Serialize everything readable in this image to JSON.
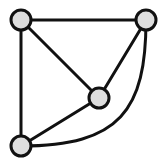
{
  "diagram": {
    "type": "graph",
    "colors": {
      "edge": "#111111",
      "node_fill": "#dedede",
      "node_stroke": "#111111",
      "background": "#ffffff"
    },
    "nodes": [
      {
        "id": "top-left",
        "x": 21,
        "y": 20,
        "r": 10
      },
      {
        "id": "top-right",
        "x": 146,
        "y": 20,
        "r": 10
      },
      {
        "id": "center",
        "x": 99,
        "y": 98,
        "r": 10
      },
      {
        "id": "bottom-left",
        "x": 21,
        "y": 146,
        "r": 10
      }
    ],
    "edges": [
      {
        "from": "top-left",
        "to": "top-right",
        "shape": "straight"
      },
      {
        "from": "top-left",
        "to": "bottom-left",
        "shape": "straight"
      },
      {
        "from": "top-left",
        "to": "center",
        "shape": "straight"
      },
      {
        "from": "top-right",
        "to": "center",
        "shape": "straight"
      },
      {
        "from": "center",
        "to": "bottom-left",
        "shape": "straight"
      },
      {
        "from": "top-right",
        "to": "bottom-left",
        "shape": "curved"
      }
    ]
  }
}
